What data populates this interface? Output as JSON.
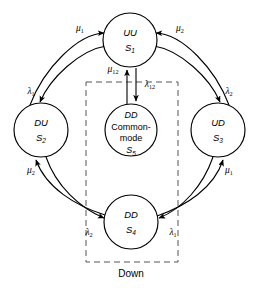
{
  "diagram": {
    "background_color": "#ffffff",
    "stroke_color": "#000000",
    "dashed_box_color": "#555555",
    "nodes": [
      {
        "id": "S1",
        "name": "uu-state",
        "line1": "UU",
        "line2": "",
        "line3": "",
        "state": "S",
        "state_sub": "1",
        "cx": 130,
        "cy": 40,
        "r": 27
      },
      {
        "id": "S2",
        "name": "du-state",
        "line1": "DU",
        "line2": "",
        "line3": "",
        "state": "S",
        "state_sub": "2",
        "cx": 41,
        "cy": 130,
        "r": 27
      },
      {
        "id": "S3",
        "name": "ud-state",
        "line1": "UD",
        "line2": "",
        "line3": "",
        "state": "S",
        "state_sub": "3",
        "cx": 218,
        "cy": 130,
        "r": 27
      },
      {
        "id": "S4",
        "name": "dd-state",
        "line1": "DD",
        "line2": "",
        "line3": "",
        "state": "S",
        "state_sub": "4",
        "cx": 131,
        "cy": 222,
        "r": 27
      },
      {
        "id": "S5",
        "name": "dd-common-mode-state",
        "line1": "DD",
        "line2": "Common-",
        "line3": "mode",
        "state": "S",
        "state_sub": "5",
        "cx": 131,
        "cy": 130,
        "r": 26
      }
    ],
    "transitions": [
      {
        "id": "t_mu1_s2_s1",
        "symbol": "μ",
        "sub": "1",
        "from": "S2",
        "to": "S1",
        "label_x": 80,
        "label_y": 29
      },
      {
        "id": "t_lam1_s1_s2",
        "symbol": "λ",
        "sub": "1",
        "from": "S1",
        "to": "S2",
        "label_x": 31,
        "label_y": 92
      },
      {
        "id": "t_mu2_s3_s1",
        "symbol": "μ",
        "sub": "2",
        "from": "S3",
        "to": "S1",
        "label_x": 180,
        "label_y": 29
      },
      {
        "id": "t_lam2_s1_s3",
        "symbol": "λ",
        "sub": "2",
        "from": "S1",
        "to": "S3",
        "label_x": 229,
        "label_y": 92
      },
      {
        "id": "t_mu2_s4_s2",
        "symbol": "μ",
        "sub": "2",
        "from": "S4",
        "to": "S2",
        "label_x": 31,
        "label_y": 171
      },
      {
        "id": "t_lam2_s2_s4",
        "symbol": "λ",
        "sub": "2",
        "from": "S2",
        "to": "S4",
        "label_x": 89,
        "label_y": 233
      },
      {
        "id": "t_mu1_s4_s3",
        "symbol": "μ",
        "sub": "1",
        "from": "S4",
        "to": "S3",
        "label_x": 229,
        "label_y": 171
      },
      {
        "id": "t_lam1_s3_s4",
        "symbol": "λ",
        "sub": "1",
        "from": "S3",
        "to": "S4",
        "label_x": 173,
        "label_y": 233
      },
      {
        "id": "t_mu12_s5_s1",
        "symbol": "μ",
        "sub": "12",
        "from": "S5",
        "to": "S1",
        "label_x": 113,
        "label_y": 70
      },
      {
        "id": "t_lam12_s1_s5",
        "symbol": "λ",
        "sub": "12",
        "from": "S1",
        "to": "S5",
        "label_x": 148,
        "label_y": 85
      }
    ],
    "group_box": {
      "name": "down-group-box",
      "x": 86,
      "y": 82,
      "width": 92,
      "height": 180,
      "label": "Down",
      "label_x": 131,
      "label_y": 274
    }
  }
}
